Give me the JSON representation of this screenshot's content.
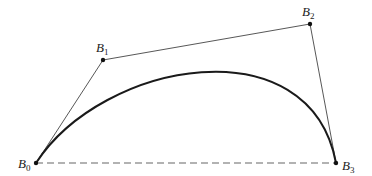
{
  "diagram": {
    "type": "cubic-bezier-curve",
    "points": [
      {
        "id": "B0",
        "label": "B",
        "sub": "0",
        "x": 36,
        "y": 163,
        "label_x": 18,
        "label_y": 168
      },
      {
        "id": "B1",
        "label": "B",
        "sub": "1",
        "x": 103,
        "y": 60,
        "label_x": 96,
        "label_y": 52
      },
      {
        "id": "B2",
        "label": "B",
        "sub": "2",
        "x": 310,
        "y": 24,
        "label_x": 302,
        "label_y": 16
      },
      {
        "id": "B3",
        "label": "B",
        "sub": "3",
        "x": 336,
        "y": 163,
        "label_x": 342,
        "label_y": 170
      }
    ],
    "colors": {
      "curve": "#1a1a1a",
      "polygon": "#444444",
      "baseline": "#666666",
      "point": "#111111"
    }
  }
}
